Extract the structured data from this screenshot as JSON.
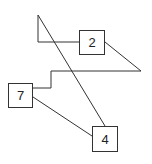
{
  "diagram": {
    "nodes": [
      {
        "id": "node-2",
        "label": "2",
        "x": 79,
        "y": 30,
        "w": 26,
        "h": 25
      },
      {
        "id": "node-7",
        "label": "7",
        "x": 8,
        "y": 83,
        "w": 25,
        "h": 25
      },
      {
        "id": "node-4",
        "label": "4",
        "x": 92,
        "y": 126,
        "w": 26,
        "h": 26
      }
    ],
    "line_color": "#333333"
  }
}
